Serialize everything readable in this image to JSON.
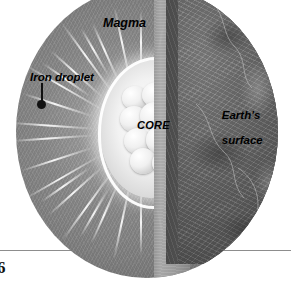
{
  "figure": {
    "background_color": "#ffffff",
    "page_number": "6"
  },
  "labels": {
    "magma": "Magma",
    "iron_droplet": "Iron droplet",
    "core": "CORE",
    "earth_surface_line1": "Earth's",
    "earth_surface_line2": "surface"
  },
  "colors": {
    "magma": "#8b8b8b",
    "cut_face": "#a4a4a4",
    "mantle": "#5d5d5d",
    "surface": "#6a6a6a",
    "core": "#f0f0f0",
    "label_text": "#000000",
    "rule": "#8d8d8d"
  },
  "rays": [
    {
      "angle": -176,
      "length": 86,
      "offset": 46
    },
    {
      "angle": -162,
      "length": 74,
      "offset": 50
    },
    {
      "angle": -150,
      "length": 90,
      "offset": 44
    },
    {
      "angle": -138,
      "length": 70,
      "offset": 52
    },
    {
      "angle": -126,
      "length": 88,
      "offset": 46
    },
    {
      "angle": -114,
      "length": 66,
      "offset": 54
    },
    {
      "angle": -102,
      "length": 80,
      "offset": 48
    },
    {
      "angle": -90,
      "length": 72,
      "offset": 50
    },
    {
      "angle": -78,
      "length": 84,
      "offset": 46
    },
    {
      "angle": -66,
      "length": 62,
      "offset": 56
    },
    {
      "angle": -54,
      "length": 76,
      "offset": 50
    },
    {
      "angle": -42,
      "length": 58,
      "offset": 58
    },
    {
      "angle": -30,
      "length": 52,
      "offset": 60
    },
    {
      "angle": -18,
      "length": 46,
      "offset": 62
    },
    {
      "angle": 0,
      "length": 44,
      "offset": 62
    },
    {
      "angle": 18,
      "length": 48,
      "offset": 62
    },
    {
      "angle": 30,
      "length": 54,
      "offset": 60
    },
    {
      "angle": 42,
      "length": 60,
      "offset": 58
    },
    {
      "angle": 54,
      "length": 78,
      "offset": 50
    },
    {
      "angle": 66,
      "length": 64,
      "offset": 56
    },
    {
      "angle": 78,
      "length": 86,
      "offset": 46
    },
    {
      "angle": 90,
      "length": 74,
      "offset": 50
    },
    {
      "angle": 102,
      "length": 82,
      "offset": 48
    },
    {
      "angle": 114,
      "length": 68,
      "offset": 54
    },
    {
      "angle": 126,
      "length": 90,
      "offset": 44
    },
    {
      "angle": 138,
      "length": 72,
      "offset": 52
    },
    {
      "angle": 150,
      "length": 88,
      "offset": 46
    },
    {
      "angle": 162,
      "length": 76,
      "offset": 50
    },
    {
      "angle": 176,
      "length": 82,
      "offset": 48
    },
    {
      "angle": -145,
      "length": 58,
      "offset": 62
    },
    {
      "angle": -120,
      "length": 54,
      "offset": 66
    },
    {
      "angle": 120,
      "length": 56,
      "offset": 64
    },
    {
      "angle": 145,
      "length": 60,
      "offset": 62
    }
  ],
  "core_lumps": [
    {
      "x": 2,
      "y": 4,
      "w": 26,
      "h": 24
    },
    {
      "x": 22,
      "y": 0,
      "w": 30,
      "h": 26
    },
    {
      "x": 42,
      "y": 8,
      "w": 26,
      "h": 24
    },
    {
      "x": 0,
      "y": 24,
      "w": 28,
      "h": 26
    },
    {
      "x": 20,
      "y": 20,
      "w": 30,
      "h": 28
    },
    {
      "x": 42,
      "y": 28,
      "w": 26,
      "h": 26
    },
    {
      "x": 4,
      "y": 46,
      "w": 28,
      "h": 26
    },
    {
      "x": 26,
      "y": 44,
      "w": 28,
      "h": 28
    },
    {
      "x": 44,
      "y": 50,
      "w": 24,
      "h": 24
    },
    {
      "x": 10,
      "y": 66,
      "w": 26,
      "h": 26
    },
    {
      "x": 32,
      "y": 68,
      "w": 28,
      "h": 26
    },
    {
      "x": 48,
      "y": 72,
      "w": 20,
      "h": 20
    }
  ]
}
